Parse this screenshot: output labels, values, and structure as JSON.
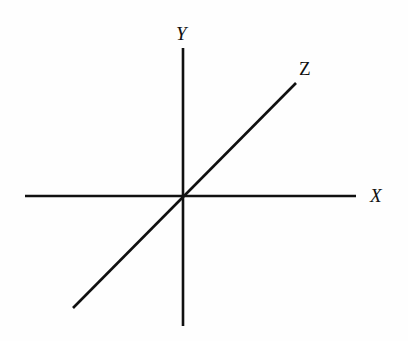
{
  "figure": {
    "name": "three-axis-coordinate-diagram",
    "background_color": "#fefefe",
    "line_color": "#101010",
    "labels": {
      "y_axis": "Y",
      "z_axis": "Z",
      "x_axis": "X"
    }
  },
  "chart_data": {
    "type": "line",
    "title": "",
    "subtitle": "",
    "xlabel": "",
    "ylabel": "",
    "grid": false,
    "legend": null,
    "annotations": [
      {
        "text": "Y",
        "x": 183,
        "y": 33,
        "style": "italic-serif"
      },
      {
        "text": "Z",
        "x": 306,
        "y": 68,
        "style": "roman-serif"
      },
      {
        "text": "X",
        "x": 377,
        "y": 195,
        "style": "italic-serif"
      }
    ],
    "axes": [
      {
        "name": "X",
        "label": "X",
        "orientation": "horizontal",
        "x1": 25,
        "y1": 196,
        "x2": 356,
        "y2": 196,
        "stroke_width": 2.6,
        "color": "#101010"
      },
      {
        "name": "Y",
        "label": "Y",
        "orientation": "vertical",
        "x1": 183,
        "y1": 48,
        "x2": 183,
        "y2": 326,
        "stroke_width": 2.6,
        "color": "#101010"
      },
      {
        "name": "Z",
        "label": "Z",
        "orientation": "diagonal",
        "x1": 73,
        "y1": 308,
        "x2": 296,
        "y2": 83,
        "stroke_width": 2.6,
        "color": "#101010"
      }
    ],
    "origin": {
      "x": 183,
      "y": 196
    }
  }
}
